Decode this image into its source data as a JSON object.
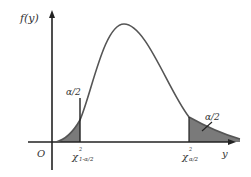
{
  "diagram": {
    "type": "probability-density-curve",
    "y_axis_label": "f(y)",
    "x_axis_label": "y",
    "origin_label": "O",
    "left_tail_label": "α/2",
    "right_tail_label": "α/2",
    "left_critical_label": "χ",
    "left_critical_sup": "2",
    "left_critical_sub": "1-α/2",
    "right_critical_label": "χ",
    "right_critical_sup": "2",
    "right_critical_sub": "α/2",
    "colors": {
      "curve": "#555555",
      "axis": "#222222",
      "shade": "#7a7a7a"
    }
  }
}
